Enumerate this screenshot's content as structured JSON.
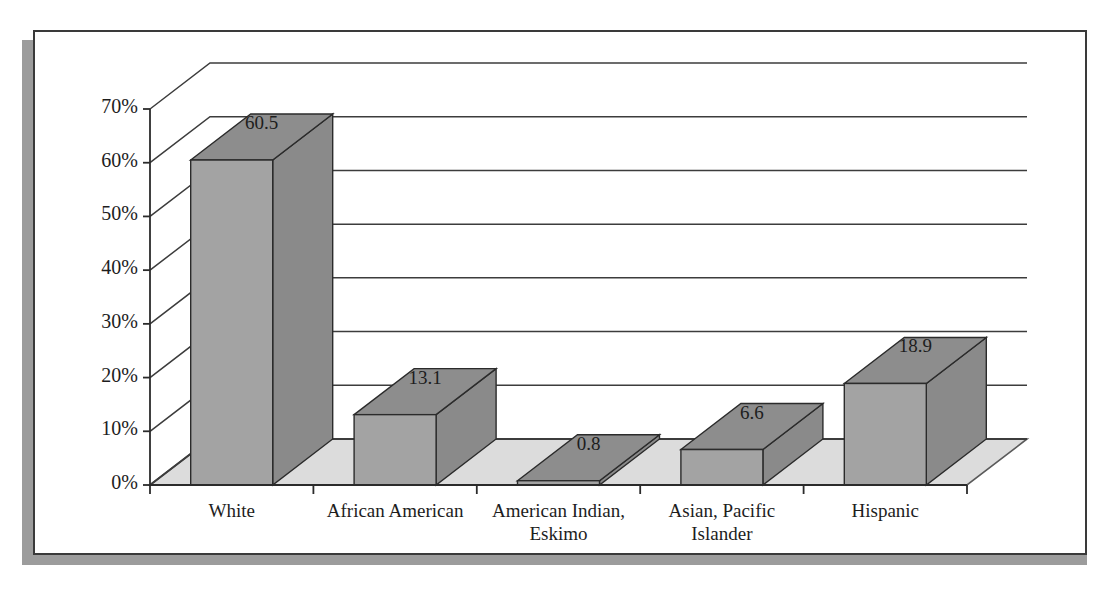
{
  "chart_data": {
    "type": "bar",
    "title": "",
    "subtitle": "",
    "xlabel": "",
    "ylabel": "",
    "categories": [
      "White",
      "African American",
      "American Indian, Eskimo",
      "Asian, Pacific Islander",
      "Hispanic"
    ],
    "category_lines": [
      [
        "White"
      ],
      [
        "African American"
      ],
      [
        "American Indian,",
        "Eskimo"
      ],
      [
        "Asian, Pacific",
        "Islander"
      ],
      [
        "Hispanic"
      ]
    ],
    "values": [
      60.5,
      13.1,
      0.8,
      6.6,
      18.9
    ],
    "value_labels": [
      "60.5",
      "13.1",
      "0.8",
      "6.6",
      "18.9"
    ],
    "ylim": [
      0,
      70
    ],
    "ytick_values": [
      0,
      10,
      20,
      30,
      40,
      50,
      60,
      70
    ],
    "ytick_labels": [
      "0%",
      "10%",
      "20%",
      "30%",
      "40%",
      "50%",
      "60%",
      "70%"
    ],
    "grid": true,
    "legend": null,
    "style": "3d-bar",
    "series": [
      {
        "name": "Percent of population",
        "values": [
          60.5,
          13.1,
          0.8,
          6.6,
          18.9
        ]
      }
    ]
  },
  "colors": {
    "bar_front": "#a3a3a3",
    "bar_top": "#8d8d8d",
    "bar_side": "#8a8a8a",
    "floor": "#dcdcdc",
    "floor_edge": "#5a5a5a",
    "gridline": "#3c3c3c",
    "axis": "#2b2b2b",
    "frame_border": "#3a3a3a",
    "frame_shadow": "#9c9c9c",
    "text": "#1d1d1d",
    "background": "#ffffff"
  },
  "geometry": {
    "depth_dx": 60,
    "depth_dy": -46
  }
}
